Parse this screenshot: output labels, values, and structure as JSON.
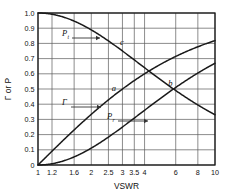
{
  "chart_data": {
    "type": "line",
    "title": "",
    "xlabel": "VSWR",
    "ylabel": "Γ or P",
    "xscale": "log",
    "xlim": [
      1,
      10
    ],
    "ylim": [
      0,
      1.0
    ],
    "grid": true,
    "legend_position": "inline-curve-labels",
    "xticks": [
      1,
      1.2,
      1.6,
      2,
      2.5,
      3,
      3.5,
      4,
      6,
      8,
      10
    ],
    "xtick_labels": [
      "1",
      "1.2",
      "1.6",
      "2",
      "2.5",
      "3",
      "3.5",
      "4",
      "6",
      "8",
      "10"
    ],
    "yticks": [
      0,
      0.1,
      0.2,
      0.3,
      0.4,
      0.5,
      0.6,
      0.7,
      0.8,
      0.9,
      1.0
    ],
    "ytick_labels": [
      "0",
      "0.1",
      "0.2",
      "0.3",
      "0.4",
      "0.5",
      "0.6",
      "0.7",
      "0.8",
      "0.9",
      "1.0"
    ],
    "series": [
      {
        "name": "a",
        "label": "Γ",
        "description": "reflection coefficient magnitude",
        "x": [
          1,
          1.2,
          1.4,
          1.6,
          1.8,
          2,
          2.5,
          3,
          3.5,
          4,
          5,
          6,
          8,
          10
        ],
        "values": [
          0.0,
          0.091,
          0.167,
          0.231,
          0.286,
          0.333,
          0.429,
          0.5,
          0.556,
          0.6,
          0.667,
          0.714,
          0.778,
          0.818
        ]
      },
      {
        "name": "b",
        "label": "P_r",
        "description": "reflected power fraction",
        "x": [
          1,
          1.2,
          1.4,
          1.6,
          1.8,
          2,
          2.5,
          3,
          3.5,
          4,
          5,
          6,
          8,
          10
        ],
        "values": [
          0.0,
          0.0083,
          0.0278,
          0.0533,
          0.0816,
          0.111,
          0.184,
          0.25,
          0.309,
          0.36,
          0.444,
          0.51,
          0.605,
          0.669
        ]
      },
      {
        "name": "c",
        "label": "P_t",
        "description": "transmitted power fraction",
        "x": [
          1,
          1.2,
          1.4,
          1.6,
          1.8,
          2,
          2.5,
          3,
          3.5,
          4,
          5,
          6,
          8,
          10
        ],
        "values": [
          1.0,
          0.9917,
          0.9722,
          0.9467,
          0.9184,
          0.889,
          0.816,
          0.75,
          0.691,
          0.64,
          0.556,
          0.49,
          0.395,
          0.331
        ]
      }
    ],
    "curve_labels": [
      {
        "name": "c",
        "text": "c"
      },
      {
        "name": "a",
        "text": "a"
      },
      {
        "name": "b",
        "text": "b"
      }
    ],
    "annotations": [
      {
        "name": "pt",
        "base": "P",
        "sub": "t"
      },
      {
        "name": "gamma",
        "base": "Γ",
        "sub": ""
      },
      {
        "name": "pr",
        "base": "P",
        "sub": "r"
      }
    ],
    "colors": {
      "curve": "#1a1a1a",
      "grid": "#5a5a5a",
      "frame": "#1a1a1a",
      "background": "#ffffff"
    }
  }
}
